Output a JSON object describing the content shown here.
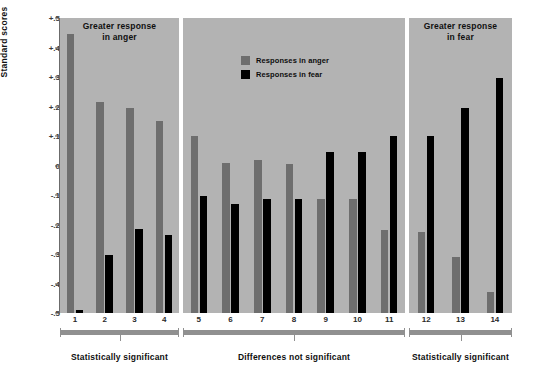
{
  "chart_data": {
    "type": "bar",
    "title": "",
    "xlabel": "",
    "ylabel": "Standard scores",
    "ylim": [
      -0.5,
      0.5
    ],
    "grid": false,
    "legend_position": "top-center",
    "categories": [
      "1",
      "2",
      "3",
      "4",
      "5",
      "6",
      "7",
      "8",
      "9",
      "10",
      "11",
      "12",
      "13",
      "14"
    ],
    "series": [
      {
        "name": "Responses in anger",
        "color": "#6e6e6e",
        "values": [
          0.445,
          0.215,
          0.195,
          0.15,
          0.1,
          0.01,
          0.02,
          0.005,
          -0.115,
          -0.115,
          -0.22,
          -0.225,
          -0.31,
          -0.43
        ]
      },
      {
        "name": "Responses in fear",
        "color": "#000000",
        "values": [
          -0.49,
          -0.305,
          -0.215,
          -0.235,
          -0.105,
          -0.13,
          -0.115,
          -0.115,
          0.045,
          0.045,
          0.1,
          0.1,
          0.195,
          0.295
        ]
      }
    ],
    "yticks": [
      "+.5",
      "+.4",
      "+.3",
      "+.2",
      "+.1",
      "0",
      "-.1",
      "-.2",
      "-.3",
      "-.4",
      "-.5"
    ],
    "ytick_values": [
      0.5,
      0.4,
      0.3,
      0.2,
      0.1,
      0,
      -0.1,
      -0.2,
      -0.3,
      -0.4,
      -0.5
    ],
    "panels": [
      {
        "id": "panel-anger",
        "title": "Greater response\nin anger",
        "title_line1": "Greater response",
        "title_line2": "in anger",
        "items": [
          "1",
          "2",
          "3",
          "4"
        ],
        "bracket_label": "Statistically significant"
      },
      {
        "id": "panel-nonsig",
        "title": "",
        "title_line1": "",
        "title_line2": "",
        "items": [
          "5",
          "6",
          "7",
          "8",
          "9",
          "10",
          "11"
        ],
        "bracket_label": "Differences not significant"
      },
      {
        "id": "panel-fear",
        "title": "Greater response\nin fear",
        "title_line1": "Greater response",
        "title_line2": "in fear",
        "items": [
          "12",
          "13",
          "14"
        ],
        "bracket_label": "Statistically significant"
      }
    ],
    "legend": [
      {
        "label": "Responses in anger",
        "color": "#6e6e6e"
      },
      {
        "label": "Responses in fear",
        "color": "#000000"
      }
    ]
  },
  "colors": {
    "panel_background": "#b3b3b3",
    "page_background": "#ffffff",
    "anger_bar": "#6e6e6e",
    "fear_bar": "#000000",
    "bracket": "#909090",
    "axis": "#6b6b6b"
  }
}
